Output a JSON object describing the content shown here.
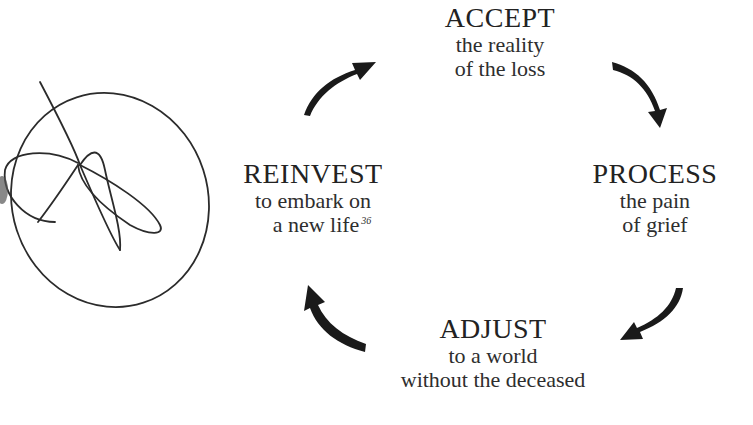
{
  "diagram": {
    "type": "cycle",
    "nodes": [
      {
        "id": "accept",
        "title": "ACCEPT",
        "lines": [
          "the reality",
          "of the loss"
        ]
      },
      {
        "id": "process",
        "title": "PROCESS",
        "lines": [
          "the pain",
          "of grief"
        ]
      },
      {
        "id": "adjust",
        "title": "ADJUST",
        "lines": [
          "to a world",
          "without the deceased"
        ]
      },
      {
        "id": "reinvest",
        "title": "REINVEST",
        "lines": [
          "to embark on",
          "a new life"
        ],
        "footnote": "36"
      }
    ],
    "edges": [
      {
        "from": "accept",
        "to": "process"
      },
      {
        "from": "process",
        "to": "adjust"
      },
      {
        "from": "adjust",
        "to": "reinvest"
      },
      {
        "from": "reinvest",
        "to": "accept"
      }
    ],
    "colors": {
      "text": "#222222",
      "arrow": "#1a1a1a",
      "scribble": "#2b2b2b",
      "background": "#ffffff"
    }
  }
}
